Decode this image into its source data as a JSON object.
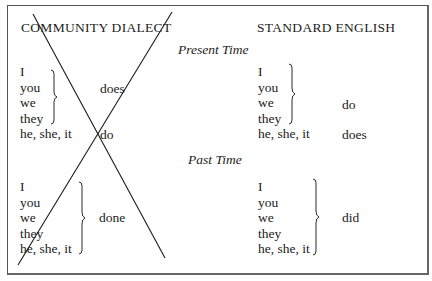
{
  "headers": {
    "left": "COMMUNITY DIALECT",
    "right": "STANDARD ENGLISH"
  },
  "sections": {
    "present": {
      "label": "Present Time",
      "community": {
        "group1_pronouns": [
          "I",
          "you",
          "we",
          "they"
        ],
        "group1_verb": "does",
        "group2_pronouns": [
          "he, she, it"
        ],
        "group2_verb": "do"
      },
      "standard": {
        "group1_pronouns": [
          "I",
          "you",
          "we",
          "they"
        ],
        "group1_verb": "do",
        "group2_pronouns": [
          "he, she, it"
        ],
        "group2_verb": "does"
      }
    },
    "past": {
      "label": "Past Time",
      "community": {
        "pronouns": [
          "I",
          "you",
          "we",
          "they",
          "he, she, it"
        ],
        "verb": "done"
      },
      "standard": {
        "pronouns": [
          "I",
          "you",
          "we",
          "they",
          "he, she, it"
        ],
        "verb": "did"
      }
    }
  },
  "annotation": "community-dialect-crossed-out",
  "colors": {
    "ink": "#1c1c1c",
    "border": "#555555",
    "background": "#ffffff"
  }
}
